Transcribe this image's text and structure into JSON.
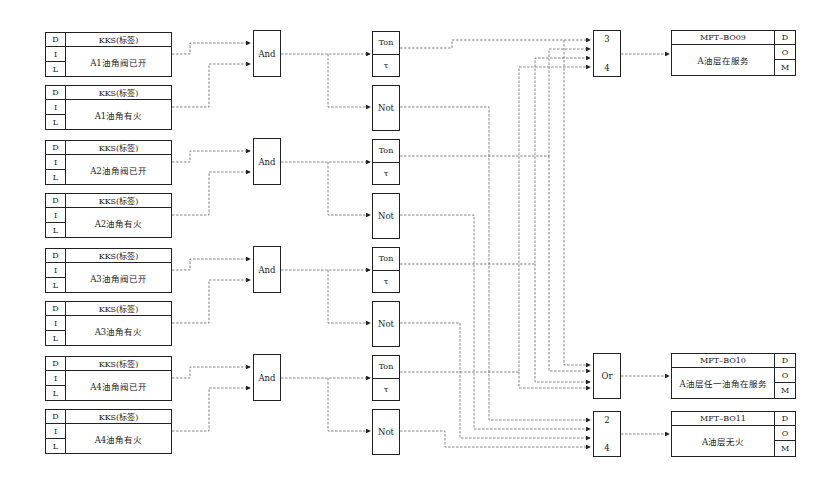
{
  "diagram": {
    "colors": {
      "line": "#222222",
      "wire": "#555555",
      "background": "#ffffff"
    },
    "inputs": [
      {
        "d": "D",
        "i": "I",
        "l": "L",
        "kks": "KKS(标签)",
        "desc": "A1油角阀已开"
      },
      {
        "d": "D",
        "i": "I",
        "l": "L",
        "kks": "KKS(标签)",
        "desc": "A1油角有火"
      },
      {
        "d": "D",
        "i": "I",
        "l": "L",
        "kks": "KKS(标签)",
        "desc": "A2油角阀已开"
      },
      {
        "d": "D",
        "i": "I",
        "l": "L",
        "kks": "KKS(标签)",
        "desc": "A2油角有火"
      },
      {
        "d": "D",
        "i": "I",
        "l": "L",
        "kks": "KKS(标签)",
        "desc": "A3油角阀已开"
      },
      {
        "d": "D",
        "i": "I",
        "l": "L",
        "kks": "KKS(标签)",
        "desc": "A3油角有火"
      },
      {
        "d": "D",
        "i": "I",
        "l": "L",
        "kks": "KKS(标签)",
        "desc": "A4油角阀已开"
      },
      {
        "d": "D",
        "i": "I",
        "l": "L",
        "kks": "KKS(标签)",
        "desc": "A4油角有火"
      }
    ],
    "and_gates": [
      {
        "label": "And"
      },
      {
        "label": "And"
      },
      {
        "label": "And"
      },
      {
        "label": "And"
      }
    ],
    "ton_blocks": [
      {
        "label": "Ton",
        "param": "τ"
      },
      {
        "label": "Ton",
        "param": "τ"
      },
      {
        "label": "Ton",
        "param": "τ"
      },
      {
        "label": "Ton",
        "param": "τ"
      }
    ],
    "not_gates": [
      {
        "label": "Not"
      },
      {
        "label": "Not"
      },
      {
        "label": "Not"
      },
      {
        "label": "Not"
      }
    ],
    "vote_3of4": {
      "top": "3",
      "bottom": "4"
    },
    "or_gate": {
      "label": "Or"
    },
    "vote_2of4": {
      "top": "2",
      "bottom": "4"
    },
    "outputs": [
      {
        "tag": "MFT–BO09",
        "desc": "A油层在服务",
        "d": "D",
        "o": "O",
        "m": "M"
      },
      {
        "tag": "MFT–BO10",
        "desc": "A油层任一油角在服务",
        "d": "D",
        "o": "O",
        "m": "M"
      },
      {
        "tag": "MFT–BO11",
        "desc": "A油层无火",
        "d": "D",
        "o": "O",
        "m": "M"
      }
    ]
  }
}
